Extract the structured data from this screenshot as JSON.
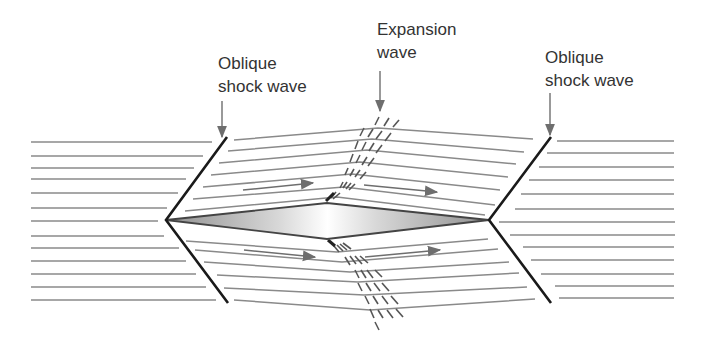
{
  "diagram": {
    "labels": {
      "left_shock": {
        "line1": "Oblique",
        "line2": "shock wave"
      },
      "expansion": {
        "line1": "Expansion",
        "line2": "wave"
      },
      "right_shock": {
        "line1": "Oblique",
        "line2": "shock wave"
      }
    },
    "colors": {
      "streamline": "#8a8a8a",
      "shock": "#1a1a1a",
      "arrow": "#6e6e6e",
      "text": "#333333",
      "airfoil_edge": "#555555",
      "airfoil_fill_dark": "#9a9a9a",
      "airfoil_fill_light": "#ffffff"
    },
    "geometry": {
      "airfoil": {
        "leading": [
          166,
          220
        ],
        "top": [
          327,
          203
        ],
        "trailing": [
          489,
          220
        ],
        "bottom": [
          327,
          239
        ]
      },
      "left_shock": {
        "top": [
          227,
          137
        ],
        "vertex": [
          166,
          220
        ],
        "bottom": [
          228,
          303
        ]
      },
      "right_shock": {
        "top": [
          551,
          137
        ],
        "vertex": [
          489,
          220
        ],
        "bottom": [
          551,
          303
        ]
      },
      "left_streamlines_y": [
        142,
        156,
        168,
        179,
        193,
        208,
        221,
        236,
        248,
        261,
        274,
        287,
        300
      ],
      "right_streamlines_y": [
        141,
        153,
        167,
        180,
        194,
        209,
        222,
        235,
        247,
        260,
        274,
        286,
        298
      ]
    }
  }
}
